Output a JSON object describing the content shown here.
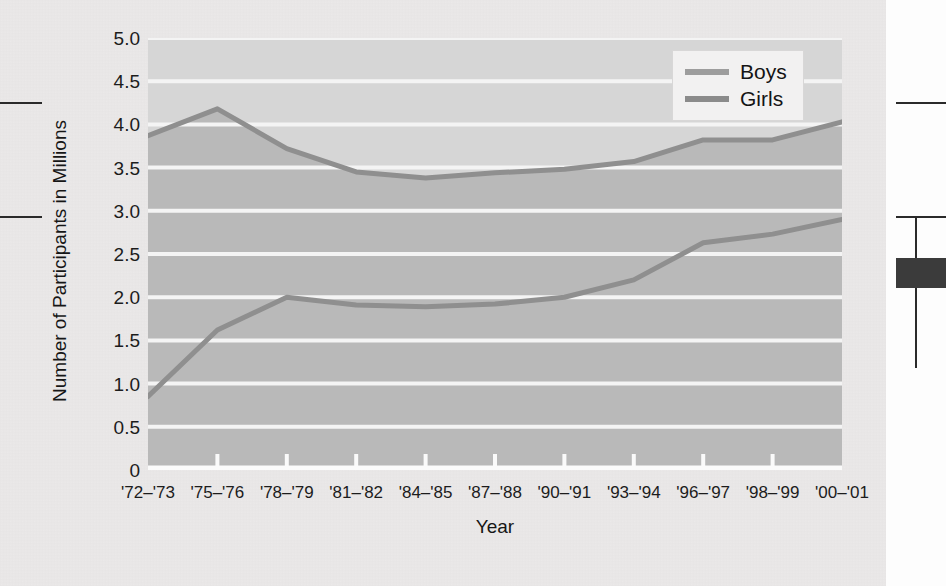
{
  "chart_data": {
    "type": "line",
    "title": "",
    "xlabel": "Year",
    "ylabel": "Number of Participants in Millions",
    "ylim": [
      0,
      5.0
    ],
    "ytick_labels": [
      "5.0",
      "4.5",
      "4.0",
      "3.5",
      "3.0",
      "2.5",
      "2.0",
      "1.5",
      "1.0",
      "0.5",
      "0"
    ],
    "ytick_values": [
      5.0,
      4.5,
      4.0,
      3.5,
      3.0,
      2.5,
      2.0,
      1.5,
      1.0,
      0.5,
      0
    ],
    "grid": true,
    "grid_color": "#f4f4f4",
    "plot_background": "#b9b9b9",
    "band_above_upper_series": "#d6d6d6",
    "legend_position": "top-right",
    "categories": [
      "'72-'73",
      "'75-'76",
      "'78-'79",
      "'81-'82",
      "'84-'85",
      "'87-'88",
      "'90-'91",
      "'93-'94",
      "'96-'97",
      "'98-'99",
      "'00-'01"
    ],
    "xtick_labels": [
      "'72–'73",
      "'75–'76",
      "'78–'79",
      "'81–'82",
      "'84–'85",
      "'87–'88",
      "'90–'91",
      "'93–'94",
      "'96–'97",
      "'98–'99",
      "'00–'01"
    ],
    "series": [
      {
        "name": "Boys",
        "color": "#8f8f8f",
        "values": [
          3.87,
          4.18,
          3.72,
          3.45,
          3.38,
          3.44,
          3.48,
          3.57,
          3.82,
          3.82,
          4.03
        ]
      },
      {
        "name": "Girls",
        "color": "#8f8f8f",
        "values": [
          0.85,
          1.62,
          2.0,
          1.91,
          1.89,
          1.92,
          2.0,
          2.2,
          2.63,
          2.73,
          2.9
        ]
      }
    ]
  },
  "legend": {
    "entries": [
      {
        "label": "Boys",
        "swatch_color": "#9d9d9d"
      },
      {
        "label": "Girls",
        "swatch_color": "#8b8b8b"
      }
    ]
  },
  "axes": {
    "x_title": "Year",
    "y_title": "Number of Participants in Millions"
  }
}
